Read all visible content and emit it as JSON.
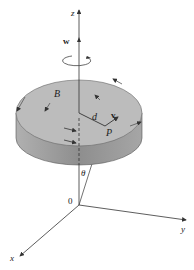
{
  "diagram": {
    "type": "rotating-disk-3d-axes",
    "labels": {
      "z_axis": "z",
      "y_axis": "y",
      "x_axis": "x",
      "origin": "0",
      "angular_velocity": "w",
      "body": "B",
      "distance": "d",
      "velocity": "v",
      "point": "P",
      "angle": "θ"
    },
    "colors": {
      "disk_top": "#b8b8b8",
      "disk_side": "#9a9a9a",
      "lines": "#333333",
      "background": "#ffffff"
    }
  }
}
